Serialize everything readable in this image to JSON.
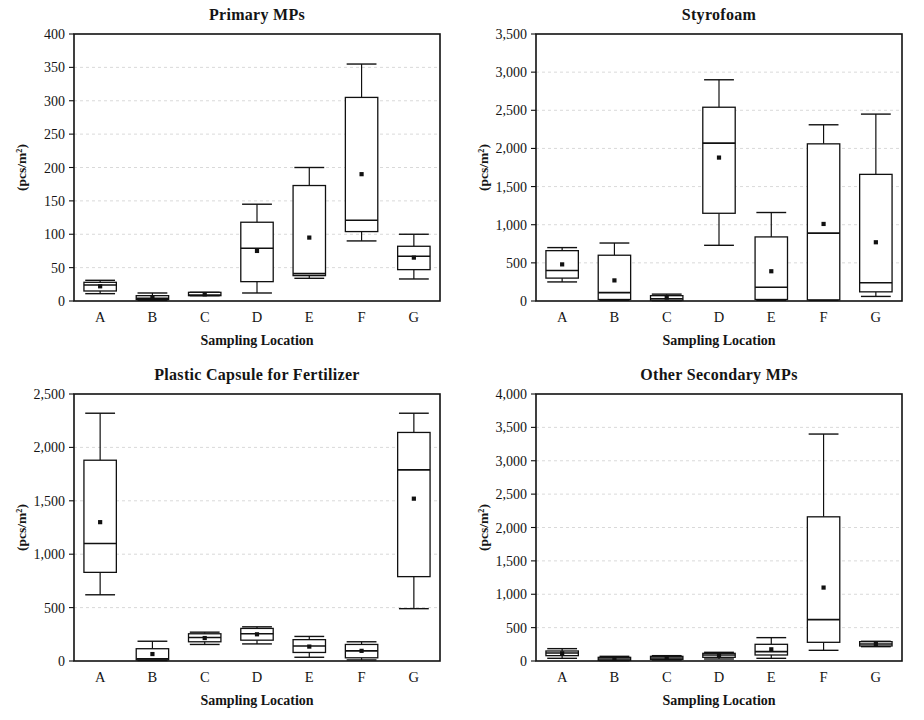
{
  "figure": {
    "categories": [
      "A",
      "B",
      "C",
      "D",
      "E",
      "F",
      "G"
    ],
    "xlabel": "Sampling Location",
    "ylabel": "(pcs/m²)"
  },
  "chart_data": [
    {
      "type": "box",
      "panel": "top-left",
      "title": "Primary MPs",
      "xlabel": "Sampling Location",
      "ylabel": "(pcs/m²)",
      "categories": [
        "A",
        "B",
        "C",
        "D",
        "E",
        "F",
        "G"
      ],
      "ylim": [
        0,
        400
      ],
      "yticks": [
        0,
        50,
        100,
        150,
        200,
        250,
        300,
        350,
        400
      ],
      "ytick_labels": [
        "0",
        "50",
        "100",
        "150",
        "200",
        "250",
        "300",
        "350",
        "400"
      ],
      "grid": true,
      "boxes": [
        {
          "label": "A",
          "min": 11,
          "q1": 15,
          "median": 24,
          "q3": 28,
          "max": 31,
          "mean": 22
        },
        {
          "label": "B",
          "min": 1,
          "q1": 2,
          "median": 4,
          "q3": 8,
          "max": 12,
          "mean": 5
        },
        {
          "label": "C",
          "min": 8,
          "q1": 8,
          "median": 9,
          "q3": 13,
          "max": 13,
          "mean": 10
        },
        {
          "label": "D",
          "min": 12,
          "q1": 29,
          "median": 79,
          "q3": 118,
          "max": 145,
          "mean": 75
        },
        {
          "label": "E",
          "min": 34,
          "q1": 38,
          "median": 41,
          "q3": 173,
          "max": 200,
          "mean": 95
        },
        {
          "label": "F",
          "min": 90,
          "q1": 104,
          "median": 121,
          "q3": 305,
          "max": 355,
          "mean": 190
        },
        {
          "label": "G",
          "min": 33,
          "q1": 47,
          "median": 67,
          "q3": 82,
          "max": 100,
          "mean": 65
        }
      ]
    },
    {
      "type": "box",
      "panel": "top-right",
      "title": "Styrofoam",
      "xlabel": "Sampling Location",
      "ylabel": "(pcs/m²)",
      "categories": [
        "A",
        "B",
        "C",
        "D",
        "E",
        "F",
        "G"
      ],
      "ylim": [
        0,
        3500
      ],
      "yticks": [
        0,
        500,
        1000,
        1500,
        2000,
        2500,
        3000,
        3500
      ],
      "ytick_labels": [
        "0",
        "500",
        "1,000",
        "1,500",
        "2,000",
        "2,500",
        "3,000",
        "3,500"
      ],
      "grid": true,
      "boxes": [
        {
          "label": "A",
          "min": 250,
          "q1": 300,
          "median": 400,
          "q3": 660,
          "max": 700,
          "mean": 480
        },
        {
          "label": "B",
          "min": 10,
          "q1": 20,
          "median": 110,
          "q3": 600,
          "max": 760,
          "mean": 270
        },
        {
          "label": "C",
          "min": 5,
          "q1": 10,
          "median": 30,
          "q3": 70,
          "max": 90,
          "mean": 45
        },
        {
          "label": "D",
          "min": 730,
          "q1": 1150,
          "median": 2070,
          "q3": 2540,
          "max": 2900,
          "mean": 1880
        },
        {
          "label": "E",
          "min": 10,
          "q1": 20,
          "median": 180,
          "q3": 840,
          "max": 1160,
          "mean": 390
        },
        {
          "label": "F",
          "min": 10,
          "q1": 15,
          "median": 890,
          "q3": 2060,
          "max": 2310,
          "mean": 1010
        },
        {
          "label": "G",
          "min": 60,
          "q1": 120,
          "median": 240,
          "q3": 1660,
          "max": 2450,
          "mean": 770
        }
      ]
    },
    {
      "type": "box",
      "panel": "bottom-left",
      "title": "Plastic Capsule for Fertilizer",
      "xlabel": "Sampling Location",
      "ylabel": "(pcs/m²)",
      "categories": [
        "A",
        "B",
        "C",
        "D",
        "E",
        "F",
        "G"
      ],
      "ylim": [
        0,
        2500
      ],
      "yticks": [
        0,
        500,
        1000,
        1500,
        2000,
        2500
      ],
      "ytick_labels": [
        "0",
        "500",
        "1,000",
        "1,500",
        "2,000",
        "2,500"
      ],
      "grid": true,
      "boxes": [
        {
          "label": "A",
          "min": 620,
          "q1": 830,
          "median": 1100,
          "q3": 1880,
          "max": 2320,
          "mean": 1300
        },
        {
          "label": "B",
          "min": 5,
          "q1": 10,
          "median": 20,
          "q3": 115,
          "max": 185,
          "mean": 65
        },
        {
          "label": "C",
          "min": 155,
          "q1": 180,
          "median": 220,
          "q3": 255,
          "max": 270,
          "mean": 215
        },
        {
          "label": "D",
          "min": 160,
          "q1": 195,
          "median": 255,
          "q3": 305,
          "max": 320,
          "mean": 250
        },
        {
          "label": "E",
          "min": 35,
          "q1": 80,
          "median": 140,
          "q3": 200,
          "max": 230,
          "mean": 135
        },
        {
          "label": "F",
          "min": 10,
          "q1": 30,
          "median": 95,
          "q3": 155,
          "max": 180,
          "mean": 95
        },
        {
          "label": "G",
          "min": 490,
          "q1": 790,
          "median": 1790,
          "q3": 2140,
          "max": 2320,
          "mean": 1520
        }
      ]
    },
    {
      "type": "box",
      "panel": "bottom-right",
      "title": "Other Secondary MPs",
      "xlabel": "Sampling Location",
      "ylabel": "(pcs/m²)",
      "categories": [
        "A",
        "B",
        "C",
        "D",
        "E",
        "F",
        "G"
      ],
      "ylim": [
        0,
        4000
      ],
      "yticks": [
        0,
        500,
        1000,
        1500,
        2000,
        2500,
        3000,
        3500,
        4000
      ],
      "ytick_labels": [
        "0",
        "500",
        "1,000",
        "1,500",
        "2,000",
        "2,500",
        "3,000",
        "3,500",
        "4,000"
      ],
      "grid": true,
      "boxes": [
        {
          "label": "A",
          "min": 40,
          "q1": 80,
          "median": 120,
          "q3": 150,
          "max": 185,
          "mean": 115
        },
        {
          "label": "B",
          "min": 5,
          "q1": 10,
          "median": 30,
          "q3": 55,
          "max": 70,
          "mean": 35
        },
        {
          "label": "C",
          "min": 15,
          "q1": 25,
          "median": 45,
          "q3": 70,
          "max": 80,
          "mean": 50
        },
        {
          "label": "D",
          "min": 30,
          "q1": 55,
          "median": 90,
          "q3": 115,
          "max": 130,
          "mean": 85
        },
        {
          "label": "E",
          "min": 40,
          "q1": 90,
          "median": 140,
          "q3": 250,
          "max": 350,
          "mean": 175
        },
        {
          "label": "F",
          "min": 160,
          "q1": 280,
          "median": 620,
          "q3": 2160,
          "max": 3400,
          "mean": 1100
        },
        {
          "label": "G",
          "min": 215,
          "q1": 225,
          "median": 255,
          "q3": 290,
          "max": 295,
          "mean": 255
        }
      ]
    }
  ]
}
